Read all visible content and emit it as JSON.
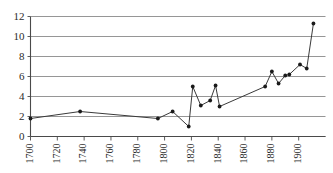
{
  "chart_data": {
    "type": "line",
    "title": "",
    "subtitle": "",
    "xlabel": "",
    "ylabel": "",
    "xlim": [
      1700,
      1913
    ],
    "ylim": [
      0,
      12
    ],
    "grid": true,
    "legend": "none",
    "y_ticks": [
      0,
      2,
      4,
      6,
      8,
      10,
      12
    ],
    "x_ticks": [
      1700,
      1720,
      1740,
      1760,
      1780,
      1800,
      1820,
      1840,
      1860,
      1880,
      1900
    ],
    "x": [
      1700,
      1737,
      1795,
      1806,
      1818,
      1821,
      1827,
      1834,
      1838,
      1841,
      1875,
      1880,
      1885,
      1890,
      1893,
      1901,
      1906,
      1911
    ],
    "values": [
      1.8,
      2.5,
      1.8,
      2.5,
      1.0,
      5.0,
      3.1,
      3.6,
      5.1,
      3.0,
      5.0,
      6.5,
      5.3,
      6.1,
      6.2,
      7.2,
      6.8,
      11.3
    ],
    "series": [
      {
        "name": "series-1",
        "x": [
          1700,
          1737,
          1795,
          1806,
          1818,
          1821,
          1827,
          1834,
          1838,
          1841,
          1875,
          1880,
          1885,
          1890,
          1893,
          1901,
          1906,
          1911
        ],
        "values": [
          1.8,
          2.5,
          1.8,
          2.5,
          1.0,
          5.0,
          3.1,
          3.6,
          5.1,
          3.0,
          5.0,
          6.5,
          5.3,
          6.1,
          6.2,
          7.2,
          6.8,
          11.3
        ]
      }
    ],
    "colors": {
      "line": "#3a3a3a",
      "marker": "#1a1a1a",
      "grid": "#8a8a8a",
      "axis": "#4a4a4a",
      "background": "#ffffff"
    }
  }
}
